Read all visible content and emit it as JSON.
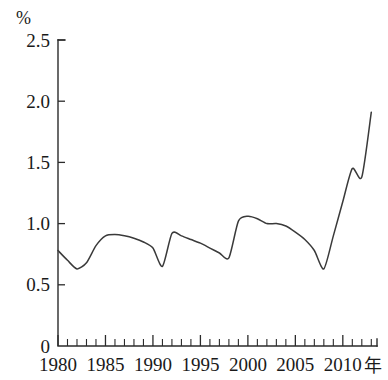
{
  "chart_data": {
    "type": "line",
    "title": "",
    "subtitle": "",
    "xlabel": "年",
    "ylabel": "%",
    "y_unit_label": "%",
    "x_unit_label": "年",
    "xlim": [
      1980,
      2013
    ],
    "ylim": [
      0,
      2.5
    ],
    "y_ticks": [
      0,
      0.5,
      1.0,
      1.5,
      2.0,
      2.5
    ],
    "y_tick_labels": [
      "0",
      "0.5",
      "1.0",
      "1.5",
      "2.0",
      "2.5"
    ],
    "x_ticks": [
      1980,
      1985,
      1990,
      1995,
      2000,
      2005,
      2010
    ],
    "x_tick_labels": [
      "1980",
      "1985",
      "1990",
      "1995",
      "2000",
      "2005",
      "2010"
    ],
    "x_minor_tick_step": 1,
    "grid": false,
    "legend": null,
    "legend_position": "none",
    "series": [
      {
        "name": "",
        "color": "#3a3a3a",
        "x": [
          1980,
          1981,
          1982,
          1983,
          1984,
          1985,
          1986,
          1987,
          1988,
          1989,
          1990,
          1991,
          1992,
          1993,
          1994,
          1995,
          1996,
          1997,
          1998,
          1999,
          2000,
          2001,
          2002,
          2003,
          2004,
          2005,
          2006,
          2007,
          2008,
          2009,
          2010,
          2011,
          2012,
          2013
        ],
        "values": [
          0.78,
          0.7,
          0.63,
          0.68,
          0.82,
          0.9,
          0.91,
          0.9,
          0.88,
          0.85,
          0.8,
          0.65,
          0.92,
          0.9,
          0.87,
          0.84,
          0.8,
          0.76,
          0.72,
          1.02,
          1.06,
          1.04,
          1.0,
          1.0,
          0.98,
          0.93,
          0.87,
          0.78,
          0.63,
          0.9,
          1.18,
          1.45,
          1.38,
          1.91
        ]
      }
    ]
  }
}
